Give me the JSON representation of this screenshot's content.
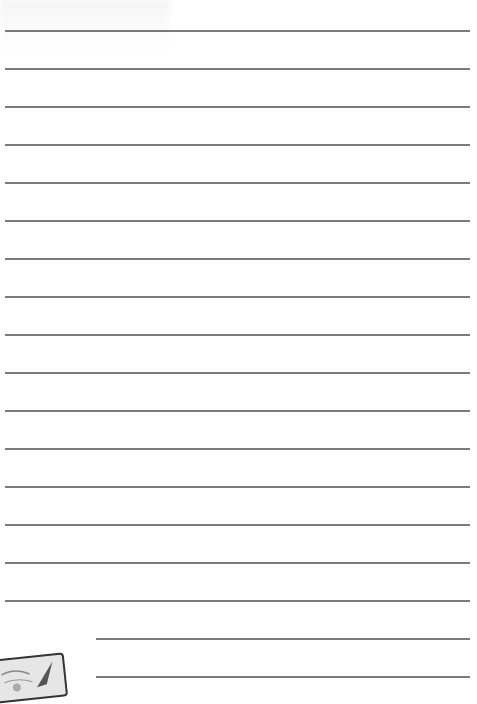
{
  "document": {
    "type": "lined-stationery",
    "width": 477,
    "height": 678,
    "background_color": "#ffffff",
    "rule_color": "#7a7a7a",
    "rules": {
      "count": 18,
      "first_y": 30,
      "spacing": 38,
      "full_width": {
        "x_start": 5,
        "x_end": 470,
        "count": 16
      },
      "indented": {
        "x_start": 96,
        "x_end": 470,
        "count": 2
      }
    },
    "decoration": {
      "corner_image": "stamp-illustration",
      "ghost_text": "illegible bleed-through (top-left)"
    }
  }
}
